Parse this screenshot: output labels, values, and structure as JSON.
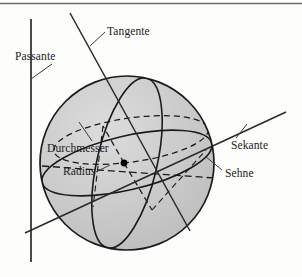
{
  "figure": {
    "background_color": "#fdfdfc",
    "sphere": {
      "fill_color": "#c9c9c9",
      "outline_color": "#1b1b1b",
      "center_dot_color": "#000000",
      "cx": 127,
      "cy": 163,
      "r": 87
    },
    "line_color": "#2a2a2a",
    "frame": {
      "top_rule_color": "#6d6d6d",
      "top_rule_y": 3
    }
  },
  "labels": {
    "passante": "Passante",
    "tangente": "Tangente",
    "durchmesser": "Durchmesser",
    "radius": "Radius",
    "sekante": "Sekante",
    "sehne": "Sehne"
  }
}
